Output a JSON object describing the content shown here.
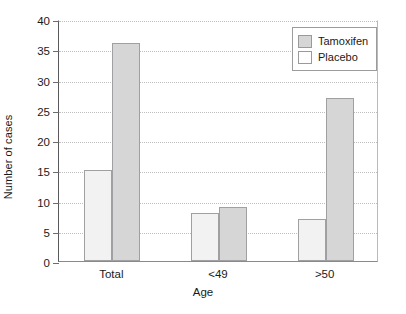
{
  "chart_data": {
    "type": "bar",
    "title": "",
    "xlabel": "Age",
    "ylabel": "Number of cases",
    "categories": [
      "Total",
      "<49",
      ">50"
    ],
    "series": [
      {
        "name": "Placebo",
        "values": [
          15,
          8,
          7
        ],
        "color": "#f2f2f2"
      },
      {
        "name": "Tamoxifen",
        "values": [
          36,
          9,
          27
        ],
        "color": "#d6d6d6"
      }
    ],
    "ylim": [
      0,
      40
    ],
    "yticks": [
      0,
      5,
      10,
      15,
      20,
      25,
      30,
      35,
      40
    ],
    "ytick_labels": [
      "0",
      "5",
      "10",
      "15",
      "20",
      "25",
      "30",
      "35",
      "40"
    ],
    "grid": true,
    "grid_axis": "y",
    "legend_position": "top-right",
    "legend_entries": [
      "Tamoxifen",
      "Placebo"
    ],
    "bar_order_in_group": [
      "Placebo",
      "Tamoxifen"
    ]
  },
  "legend": {
    "items": [
      {
        "label": "Tamoxifen",
        "swatch": "tamoxifen"
      },
      {
        "label": "Placebo",
        "swatch": "placebo"
      }
    ]
  }
}
